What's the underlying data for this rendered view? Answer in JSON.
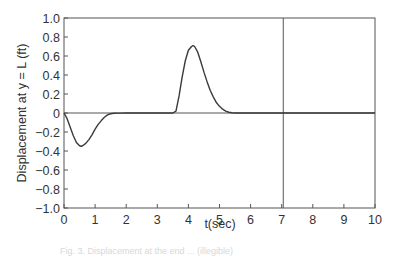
{
  "chart_data": {
    "type": "line",
    "title": "",
    "xlabel": "t(sec)",
    "ylabel": "Displacement at y = L (ft)",
    "xlim": [
      0,
      10
    ],
    "ylim": [
      -1.0,
      1.0
    ],
    "x_ticks": [
      "0",
      "1",
      "2",
      "3",
      "4",
      "5",
      "6",
      "7",
      "8",
      "9",
      "10"
    ],
    "y_ticks": [
      "1.0",
      "0.8",
      "0.6",
      "0.4",
      "0.2",
      "0",
      "−0.2",
      "−0.4",
      "−0.6",
      "−0.8",
      "−1.0"
    ],
    "grid": false,
    "legend": null,
    "reference_lines": [
      {
        "orientation": "horizontal",
        "y": 0
      },
      {
        "orientation": "vertical",
        "x": 7.05
      }
    ],
    "series": [
      {
        "name": "displacement",
        "x": [
          0,
          0.1,
          0.2,
          0.3,
          0.4,
          0.5,
          0.55,
          0.6,
          0.7,
          0.8,
          0.9,
          1.0,
          1.1,
          1.2,
          1.3,
          1.4,
          1.5,
          1.6,
          1.8,
          2.0,
          2.5,
          3.0,
          3.5,
          3.6,
          3.7,
          3.8,
          3.9,
          4.0,
          4.1,
          4.15,
          4.2,
          4.3,
          4.4,
          4.5,
          4.6,
          4.7,
          4.8,
          4.9,
          5.0,
          5.1,
          5.2,
          5.3,
          5.4,
          5.5,
          6.0,
          7.0,
          8.0,
          9.0,
          10.0
        ],
        "values": [
          0,
          -0.06,
          -0.15,
          -0.24,
          -0.31,
          -0.345,
          -0.35,
          -0.345,
          -0.32,
          -0.28,
          -0.23,
          -0.17,
          -0.12,
          -0.08,
          -0.045,
          -0.02,
          -0.008,
          -0.003,
          -0.001,
          0,
          0,
          0,
          0,
          0.02,
          0.18,
          0.38,
          0.55,
          0.66,
          0.7,
          0.71,
          0.7,
          0.64,
          0.54,
          0.43,
          0.33,
          0.24,
          0.17,
          0.11,
          0.07,
          0.04,
          0.02,
          0.008,
          0.002,
          0,
          0,
          0,
          0,
          0,
          0
        ]
      }
    ]
  },
  "figure": {
    "caption": "Fig. 3. Displacement at the end ... (illegible)"
  }
}
